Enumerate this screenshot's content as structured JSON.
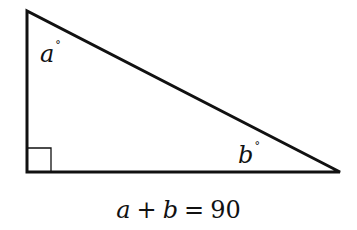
{
  "diagram": {
    "type": "right-triangle",
    "stroke_color": "#111111",
    "vertices": {
      "top": [
        27,
        11
      ],
      "bottom_left": [
        27,
        172
      ],
      "right": [
        340,
        172
      ]
    },
    "right_angle_marker": {
      "x": 27,
      "y": 148,
      "size": 24
    },
    "labels": {
      "angle_a": {
        "var": "a",
        "degree": "°"
      },
      "angle_b": {
        "var": "b",
        "degree": "°"
      }
    },
    "equation": {
      "lhs_var1": "a",
      "op_plus": "+",
      "lhs_var2": "b",
      "op_eq": "=",
      "rhs": "90"
    }
  }
}
